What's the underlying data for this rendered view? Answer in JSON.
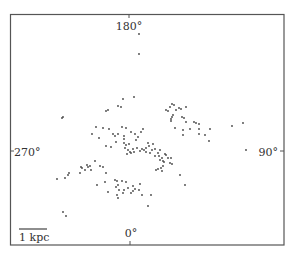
{
  "chart_data": {
    "type": "scatter",
    "title": "",
    "xlabel": "",
    "ylabel": "",
    "annotations": {
      "top": "180°",
      "bottom": "0°",
      "left": "270°",
      "right": "90°",
      "scale_bar": "1 kpc"
    },
    "frame_px": {
      "left": 10,
      "top": 14,
      "right": 284,
      "bottom": 245
    },
    "center_px": [
      130,
      151
    ],
    "scale_bar_px": {
      "x1": 19,
      "x2": 47,
      "y": 229
    },
    "grid": false,
    "legend": null,
    "marker_color": "#444444",
    "points_px": [
      [
        139,
        34
      ],
      [
        139,
        54
      ],
      [
        134,
        97
      ],
      [
        123,
        99
      ],
      [
        121,
        107
      ],
      [
        118,
        106
      ],
      [
        108,
        110
      ],
      [
        106,
        111
      ],
      [
        62,
        118
      ],
      [
        63,
        117
      ],
      [
        172,
        104
      ],
      [
        174,
        105
      ],
      [
        170,
        107
      ],
      [
        166,
        110
      ],
      [
        168,
        111
      ],
      [
        176,
        110
      ],
      [
        179,
        108
      ],
      [
        186,
        107
      ],
      [
        181,
        109
      ],
      [
        173,
        115
      ],
      [
        172,
        117
      ],
      [
        171,
        119
      ],
      [
        182,
        117
      ],
      [
        184,
        118
      ],
      [
        171,
        121
      ],
      [
        186,
        122
      ],
      [
        194,
        122
      ],
      [
        196,
        123
      ],
      [
        199,
        124
      ],
      [
        232,
        126
      ],
      [
        243,
        123
      ],
      [
        96,
        127
      ],
      [
        103,
        128
      ],
      [
        109,
        129
      ],
      [
        122,
        127
      ],
      [
        126,
        128
      ],
      [
        143,
        129
      ],
      [
        141,
        132
      ],
      [
        92,
        134
      ],
      [
        113,
        134
      ],
      [
        118,
        134
      ],
      [
        131,
        132
      ],
      [
        135,
        134
      ],
      [
        124,
        136
      ],
      [
        124,
        139
      ],
      [
        138,
        137
      ],
      [
        136,
        140
      ],
      [
        99,
        138
      ],
      [
        115,
        136
      ],
      [
        175,
        128
      ],
      [
        183,
        130
      ],
      [
        190,
        129
      ],
      [
        199,
        129
      ],
      [
        210,
        129
      ],
      [
        183,
        135
      ],
      [
        199,
        134
      ],
      [
        205,
        135
      ],
      [
        209,
        141
      ],
      [
        106,
        146
      ],
      [
        111,
        147
      ],
      [
        116,
        142
      ],
      [
        129,
        144
      ],
      [
        124,
        143
      ],
      [
        126,
        145
      ],
      [
        125,
        148
      ],
      [
        128,
        150
      ],
      [
        130,
        152
      ],
      [
        127,
        154
      ],
      [
        131,
        153
      ],
      [
        133,
        149
      ],
      [
        134,
        152
      ],
      [
        137,
        148
      ],
      [
        140,
        151
      ],
      [
        142,
        149
      ],
      [
        144,
        150
      ],
      [
        146,
        148
      ],
      [
        149,
        146
      ],
      [
        146,
        152
      ],
      [
        150,
        153
      ],
      [
        152,
        150
      ],
      [
        155,
        149
      ],
      [
        158,
        153
      ],
      [
        160,
        150
      ],
      [
        165,
        154
      ],
      [
        148,
        143
      ],
      [
        153,
        144
      ],
      [
        155,
        156
      ],
      [
        159,
        156
      ],
      [
        162,
        158
      ],
      [
        166,
        155
      ],
      [
        160,
        160
      ],
      [
        163,
        161
      ],
      [
        164,
        162
      ],
      [
        170,
        163
      ],
      [
        168,
        158
      ],
      [
        172,
        164
      ],
      [
        171,
        158
      ],
      [
        163,
        166
      ],
      [
        161,
        168
      ],
      [
        156,
        170
      ],
      [
        158,
        169
      ],
      [
        162,
        171
      ],
      [
        180,
        175
      ],
      [
        185,
        185
      ],
      [
        246,
        150
      ],
      [
        95,
        161
      ],
      [
        90,
        166
      ],
      [
        88,
        167
      ],
      [
        87,
        165
      ],
      [
        82,
        168
      ],
      [
        85,
        170
      ],
      [
        81,
        167
      ],
      [
        91,
        170
      ],
      [
        80,
        173
      ],
      [
        100,
        166
      ],
      [
        103,
        167
      ],
      [
        106,
        173
      ],
      [
        57,
        179
      ],
      [
        65,
        178
      ],
      [
        68,
        175
      ],
      [
        69,
        173
      ],
      [
        97,
        185
      ],
      [
        105,
        182
      ],
      [
        115,
        180
      ],
      [
        117,
        181
      ],
      [
        122,
        181
      ],
      [
        126,
        182
      ],
      [
        118,
        185
      ],
      [
        116,
        187
      ],
      [
        119,
        190
      ],
      [
        124,
        190
      ],
      [
        128,
        188
      ],
      [
        133,
        186
      ],
      [
        135,
        189
      ],
      [
        133,
        191
      ],
      [
        131,
        193
      ],
      [
        139,
        190
      ],
      [
        140,
        184
      ],
      [
        123,
        193
      ],
      [
        108,
        192
      ],
      [
        117,
        195
      ],
      [
        118,
        198
      ],
      [
        142,
        195
      ],
      [
        151,
        195
      ],
      [
        148,
        206
      ],
      [
        63,
        212
      ],
      [
        66,
        216
      ]
    ]
  }
}
